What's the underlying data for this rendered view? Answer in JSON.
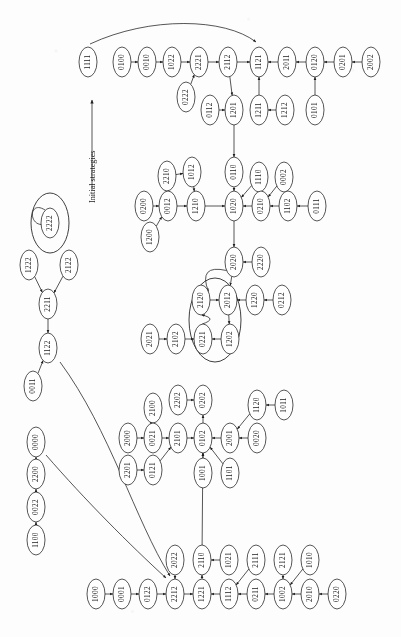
{
  "figure": {
    "kind": "state-transition-diagram",
    "axis_label": "Initial strategies",
    "node_shape": "ellipse",
    "label_orientation": "rotated-90-ccw",
    "colors": {
      "stroke": "#1d1d1d",
      "node_fill": "#ffffff",
      "background": "#fdfdfd"
    }
  },
  "chart_data": {
    "type": "diagram",
    "title": "",
    "xlabel": "",
    "ylabel": "Initial strategies",
    "annotations": [
      "Initial strategies"
    ],
    "nodes": [
      {
        "id": "1111",
        "x": 88,
        "y": 62
      },
      {
        "id": "0100",
        "x": 122,
        "y": 62
      },
      {
        "id": "0010",
        "x": 147,
        "y": 62
      },
      {
        "id": "1022",
        "x": 172,
        "y": 62
      },
      {
        "id": "2221",
        "x": 199,
        "y": 62
      },
      {
        "id": "2112",
        "x": 228,
        "y": 62
      },
      {
        "id": "1121",
        "x": 259,
        "y": 62
      },
      {
        "id": "2011",
        "x": 287,
        "y": 62
      },
      {
        "id": "0120",
        "x": 315,
        "y": 62
      },
      {
        "id": "0201",
        "x": 343,
        "y": 62
      },
      {
        "id": "2002",
        "x": 371,
        "y": 62
      },
      {
        "id": "0222",
        "x": 186,
        "y": 97
      },
      {
        "id": "0112",
        "x": 210,
        "y": 110
      },
      {
        "id": "1201",
        "x": 234,
        "y": 110
      },
      {
        "id": "1211",
        "x": 259,
        "y": 110
      },
      {
        "id": "1212",
        "x": 285,
        "y": 110
      },
      {
        "id": "0101",
        "x": 315,
        "y": 110
      },
      {
        "id": "0110",
        "x": 234,
        "y": 172
      },
      {
        "id": "2210",
        "x": 167,
        "y": 176
      },
      {
        "id": "1012",
        "x": 192,
        "y": 172
      },
      {
        "id": "1110",
        "x": 259,
        "y": 177
      },
      {
        "id": "0002",
        "x": 284,
        "y": 177
      },
      {
        "id": "0200",
        "x": 144,
        "y": 206
      },
      {
        "id": "0012",
        "x": 168,
        "y": 206
      },
      {
        "id": "1210",
        "x": 196,
        "y": 206
      },
      {
        "id": "1020",
        "x": 234,
        "y": 206
      },
      {
        "id": "0210",
        "x": 261,
        "y": 206
      },
      {
        "id": "1102",
        "x": 288,
        "y": 206
      },
      {
        "id": "0111",
        "x": 317,
        "y": 206
      },
      {
        "id": "1200",
        "x": 150,
        "y": 237
      },
      {
        "id": "2020",
        "x": 234,
        "y": 262
      },
      {
        "id": "2220",
        "x": 261,
        "y": 262
      },
      {
        "id": "2222",
        "x": 50,
        "y": 223
      },
      {
        "id": "1222",
        "x": 29,
        "y": 265
      },
      {
        "id": "2122",
        "x": 69,
        "y": 265
      },
      {
        "id": "2211",
        "x": 48,
        "y": 304
      },
      {
        "id": "1122",
        "x": 48,
        "y": 348
      },
      {
        "id": "0011",
        "x": 33,
        "y": 386
      },
      {
        "id": "2120",
        "x": 201,
        "y": 300
      },
      {
        "id": "2012",
        "x": 228,
        "y": 300
      },
      {
        "id": "1220",
        "x": 255,
        "y": 300
      },
      {
        "id": "0212",
        "x": 282,
        "y": 300
      },
      {
        "id": "2021",
        "x": 150,
        "y": 339
      },
      {
        "id": "2102",
        "x": 176,
        "y": 339
      },
      {
        "id": "0221",
        "x": 203,
        "y": 339
      },
      {
        "id": "1202",
        "x": 230,
        "y": 339
      },
      {
        "id": "2202",
        "x": 178,
        "y": 400
      },
      {
        "id": "0202",
        "x": 203,
        "y": 400
      },
      {
        "id": "2100",
        "x": 153,
        "y": 408
      },
      {
        "id": "1120",
        "x": 257,
        "y": 405
      },
      {
        "id": "1011",
        "x": 284,
        "y": 405
      },
      {
        "id": "2000",
        "x": 128,
        "y": 438
      },
      {
        "id": "0021",
        "x": 153,
        "y": 438
      },
      {
        "id": "2101",
        "x": 178,
        "y": 438
      },
      {
        "id": "0102",
        "x": 203,
        "y": 438
      },
      {
        "id": "2001",
        "x": 230,
        "y": 438
      },
      {
        "id": "0020",
        "x": 257,
        "y": 438
      },
      {
        "id": "2201",
        "x": 128,
        "y": 470
      },
      {
        "id": "0121",
        "x": 153,
        "y": 470
      },
      {
        "id": "1001",
        "x": 203,
        "y": 473
      },
      {
        "id": "1101",
        "x": 230,
        "y": 473
      },
      {
        "id": "0000",
        "x": 36,
        "y": 442
      },
      {
        "id": "2200",
        "x": 36,
        "y": 474
      },
      {
        "id": "0022",
        "x": 36,
        "y": 507
      },
      {
        "id": "1100",
        "x": 36,
        "y": 540
      },
      {
        "id": "1000",
        "x": 96,
        "y": 594
      },
      {
        "id": "0001",
        "x": 122,
        "y": 594
      },
      {
        "id": "0122",
        "x": 148,
        "y": 594
      },
      {
        "id": "2212",
        "x": 175,
        "y": 594
      },
      {
        "id": "1221",
        "x": 202,
        "y": 594
      },
      {
        "id": "1112",
        "x": 229,
        "y": 594
      },
      {
        "id": "0211",
        "x": 256,
        "y": 594
      },
      {
        "id": "1002",
        "x": 283,
        "y": 594
      },
      {
        "id": "2010",
        "x": 310,
        "y": 594
      },
      {
        "id": "0220",
        "x": 337,
        "y": 594
      },
      {
        "id": "2022",
        "x": 175,
        "y": 560
      },
      {
        "id": "2110",
        "x": 202,
        "y": 560
      },
      {
        "id": "1021",
        "x": 229,
        "y": 560
      },
      {
        "id": "2111",
        "x": 256,
        "y": 560
      },
      {
        "id": "2121",
        "x": 283,
        "y": 560
      },
      {
        "id": "1010",
        "x": 310,
        "y": 560
      }
    ],
    "edges": [
      {
        "from": "0100",
        "to": "0010"
      },
      {
        "from": "0010",
        "to": "1022"
      },
      {
        "from": "1022",
        "to": "2221"
      },
      {
        "from": "2221",
        "to": "2112"
      },
      {
        "from": "2112",
        "to": "1121"
      },
      {
        "from": "2011",
        "to": "1121"
      },
      {
        "from": "0120",
        "to": "2011"
      },
      {
        "from": "0201",
        "to": "0120"
      },
      {
        "from": "2002",
        "to": "0201"
      },
      {
        "from": "0222",
        "to": "2221"
      },
      {
        "from": "0112",
        "to": "1201"
      },
      {
        "from": "2112",
        "to": "1201"
      },
      {
        "from": "1211",
        "to": "1121"
      },
      {
        "from": "1212",
        "to": "1211"
      },
      {
        "from": "0101",
        "to": "0120"
      },
      {
        "from": "1201",
        "to": "0110"
      },
      {
        "from": "0110",
        "to": "1020"
      },
      {
        "from": "2210",
        "to": "1012"
      },
      {
        "from": "1012",
        "to": "1210"
      },
      {
        "from": "0200",
        "to": "0012"
      },
      {
        "from": "0012",
        "to": "1210"
      },
      {
        "from": "1210",
        "to": "1020"
      },
      {
        "from": "1110",
        "to": "1020"
      },
      {
        "from": "0210",
        "to": "1020"
      },
      {
        "from": "0002",
        "to": "0210"
      },
      {
        "from": "1102",
        "to": "0210"
      },
      {
        "from": "0111",
        "to": "1102"
      },
      {
        "from": "1200",
        "to": "0012"
      },
      {
        "from": "1020",
        "to": "2020"
      },
      {
        "from": "2220",
        "to": "2020"
      },
      {
        "from": "2020",
        "to": "2012"
      },
      {
        "from": "2020",
        "to": "2120"
      },
      {
        "from": "2120",
        "to": "2012"
      },
      {
        "from": "2012",
        "to": "1202"
      },
      {
        "from": "1202",
        "to": "0221"
      },
      {
        "from": "0221",
        "to": "2120"
      },
      {
        "from": "1220",
        "to": "2012"
      },
      {
        "from": "0212",
        "to": "1220"
      },
      {
        "from": "2021",
        "to": "2102"
      },
      {
        "from": "2102",
        "to": "0221"
      },
      {
        "from": "2222",
        "to": "2222"
      },
      {
        "from": "1222",
        "to": "2211"
      },
      {
        "from": "2122",
        "to": "2211"
      },
      {
        "from": "2211",
        "to": "1122"
      },
      {
        "from": "0011",
        "to": "1122"
      },
      {
        "from": "1122",
        "to": "2212"
      },
      {
        "from": "0000",
        "to": "0001"
      },
      {
        "from": "2200",
        "to": "0000"
      },
      {
        "from": "0022",
        "to": "2200"
      },
      {
        "from": "1100",
        "to": "0022"
      },
      {
        "from": "2202",
        "to": "0202"
      },
      {
        "from": "0102",
        "to": "0202"
      },
      {
        "from": "2100",
        "to": "0021"
      },
      {
        "from": "2000",
        "to": "0021"
      },
      {
        "from": "0021",
        "to": "2101"
      },
      {
        "from": "2101",
        "to": "0102"
      },
      {
        "from": "2001",
        "to": "0102"
      },
      {
        "from": "0020",
        "to": "2001"
      },
      {
        "from": "1120",
        "to": "2001"
      },
      {
        "from": "1011",
        "to": "1120"
      },
      {
        "from": "2201",
        "to": "0121"
      },
      {
        "from": "0121",
        "to": "2101"
      },
      {
        "from": "1001",
        "to": "0102"
      },
      {
        "from": "1101",
        "to": "0102"
      },
      {
        "from": "1000",
        "to": "0001"
      },
      {
        "from": "0001",
        "to": "0122"
      },
      {
        "from": "0122",
        "to": "2212"
      },
      {
        "from": "2212",
        "to": "1221"
      },
      {
        "from": "1221",
        "to": "2110"
      },
      {
        "from": "1112",
        "to": "1221"
      },
      {
        "from": "0211",
        "to": "1112"
      },
      {
        "from": "2111",
        "to": "1112"
      },
      {
        "from": "1002",
        "to": "0211"
      },
      {
        "from": "2121",
        "to": "1002"
      },
      {
        "from": "1010",
        "to": "1002"
      },
      {
        "from": "2010",
        "to": "1002"
      },
      {
        "from": "0220",
        "to": "2010"
      },
      {
        "from": "2022",
        "to": "2212"
      },
      {
        "from": "1021",
        "to": "2110"
      },
      {
        "from": "2110",
        "to": "0102"
      },
      {
        "from": "1111",
        "to": "1121"
      }
    ],
    "cycle_rings": [
      {
        "center_x": 50,
        "center_y": 223,
        "rx": 19,
        "ry": 30,
        "members": [
          "2222"
        ]
      },
      {
        "center_x": 215,
        "center_y": 320,
        "rx": 26,
        "ry": 42,
        "members": [
          "2120",
          "2012",
          "0221",
          "1202"
        ]
      }
    ]
  }
}
